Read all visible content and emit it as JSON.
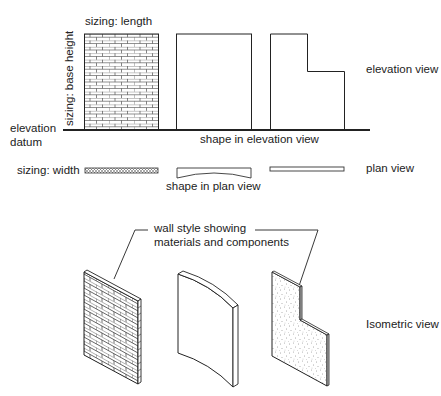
{
  "diagram": {
    "labels": {
      "sizing_length": "sizing: length",
      "sizing_base_height": "sizing: base height",
      "elevation_datum_line1": "elevation",
      "elevation_datum_line2": "datum",
      "elevation_view": "elevation view",
      "shape_in_elevation": "shape in elevation view",
      "sizing_width": "sizing: width",
      "shape_in_plan": "shape in plan view",
      "plan_view": "plan view",
      "wall_style_line1": "wall style showing",
      "wall_style_line2": "materials and components",
      "isometric_view": "Isometric view"
    },
    "walls": [
      {
        "name": "brick wall",
        "material": "brick",
        "elevation_shape": "rectangle",
        "plan_shape": "straight hatched"
      },
      {
        "name": "curved wall",
        "material": "plain",
        "elevation_shape": "rectangle",
        "plan_shape": "curved"
      },
      {
        "name": "stepped wall",
        "material": "concrete/stipple",
        "elevation_shape": "L-shape",
        "plan_shape": "thin straight"
      }
    ],
    "colors": {
      "line": "#222222",
      "background": "#ffffff"
    }
  }
}
